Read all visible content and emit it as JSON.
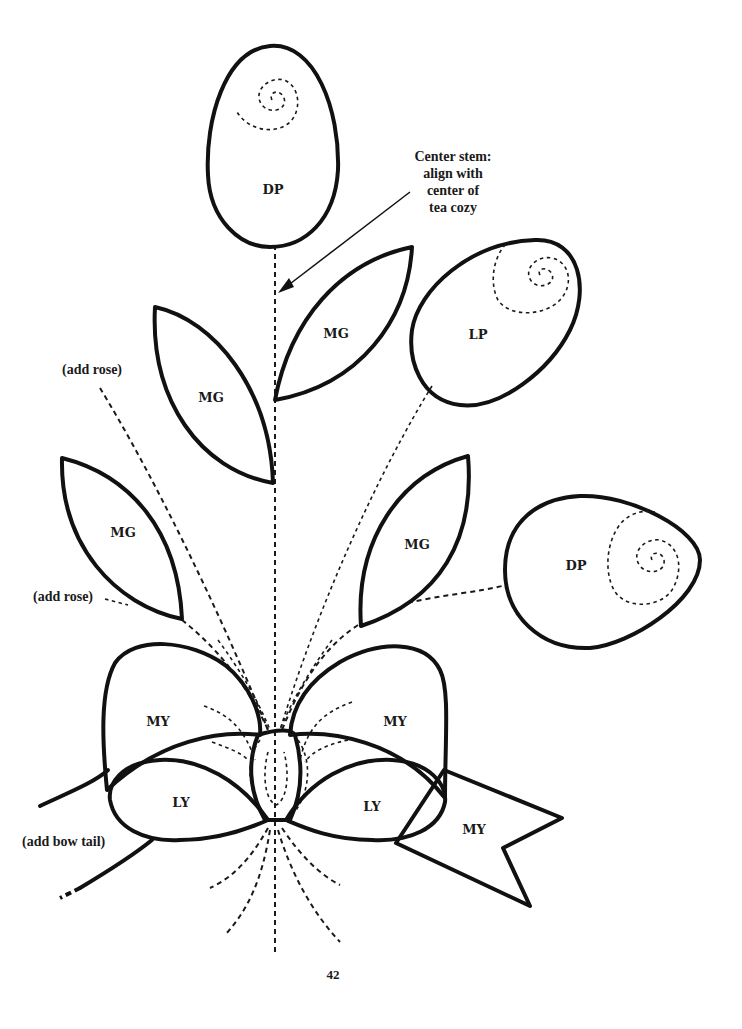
{
  "document": {
    "type": "appliqué pattern page",
    "page_number": "42"
  },
  "annotations": {
    "center_stem": [
      "Center stem:",
      "align with",
      "center of",
      "tea cozy"
    ],
    "add_rose_upper": "(add rose)",
    "add_rose_lower": "(add rose)",
    "add_bow_tail": "(add bow tail)"
  },
  "pieces": {
    "top_petal": {
      "label": "DP",
      "fill": "#d4d4d4"
    },
    "upper_right_leaf": {
      "label": "MG",
      "fill": "#dcdcdc"
    },
    "upper_left_leaf": {
      "label": "MG",
      "fill": "#dcdcdc"
    },
    "light_petal": {
      "label": "LP",
      "fill": "#ffffff"
    },
    "lower_left_leaf": {
      "label": "MG",
      "fill": "#dcdcdc"
    },
    "lower_right_leaf": {
      "label": "MG",
      "fill": "#dcdcdc"
    },
    "right_petal": {
      "label": "DP",
      "fill": "#d4d4d4"
    },
    "bow_left_loop": {
      "label": "MY",
      "fill": "#ffffff"
    },
    "bow_right_loop": {
      "label": "MY",
      "fill": "#ffffff"
    },
    "bow_left_inner": {
      "label": "LY",
      "fill": "#ffffff"
    },
    "bow_right_inner": {
      "label": "LY",
      "fill": "#ffffff"
    },
    "bow_tail_right": {
      "label": "MY",
      "fill": "#ffffff"
    }
  },
  "colors": {
    "outline": "#111111",
    "dark_fill": "#d4d4d4",
    "leaf_fill": "#dcdcdc",
    "background": "#ffffff"
  }
}
